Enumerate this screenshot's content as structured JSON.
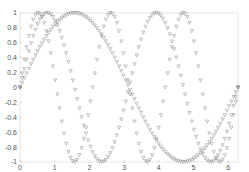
{
  "chart_data": {
    "type": "line",
    "title": "",
    "xlabel": "",
    "ylabel": "",
    "xlim": [
      0,
      6.2832
    ],
    "ylim": [
      -1,
      1
    ],
    "x_ticks": [
      "0",
      "1",
      "2",
      "3",
      "4",
      "5",
      "6"
    ],
    "y_ticks": [
      "-1",
      "-0.8",
      "-0.6",
      "-0.4",
      "-0.2",
      "0",
      "0.2",
      "0.4",
      "0.6",
      "0.8",
      "1"
    ],
    "grid": false,
    "legend": null,
    "marker": "triangle-down",
    "marker_color": "#777777",
    "x_samples": {
      "start": 0,
      "end": 6.2832,
      "count": 100
    },
    "series": [
      {
        "name": "sin(x)",
        "function": "sin(1*x)",
        "frequency": 1
      },
      {
        "name": "sin(2x)",
        "function": "sin(2*x)",
        "frequency": 2
      },
      {
        "name": "sin(3x)",
        "function": "sin(3*x)",
        "frequency": 3
      }
    ]
  }
}
